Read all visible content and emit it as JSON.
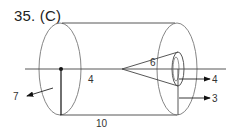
{
  "problem": {
    "number_label": "35. (C)"
  },
  "diagram": {
    "labels": {
      "cylinder_radius": "4",
      "cylinder_length": "10",
      "cone_length": "6",
      "arrow_left": "7",
      "arrow_inner_radius": "4",
      "arrow_outer_radius": "3"
    },
    "colors": {
      "line": "#333333",
      "outline": "#666666",
      "background": "#ffffff"
    }
  }
}
